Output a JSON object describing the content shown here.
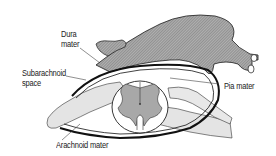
{
  "diagram": {
    "title": "",
    "labels": {
      "dura_mater_line1": "Dura",
      "dura_mater_line2": "mater",
      "subarachnoid_line1": "Subarachnoid",
      "subarachnoid_line2": "space",
      "pia_mater": "Pia mater",
      "arachnoid_mater": "Arachnoid mater"
    },
    "colors": {
      "dura_fill": "#9a9a9a",
      "grey_matter": "#a8a8a8",
      "nerve_root_fill": "#e4e4e4",
      "outline": "#1a1a1a",
      "background": "#ffffff"
    }
  }
}
